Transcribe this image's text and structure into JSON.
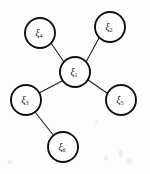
{
  "figure": {
    "type": "node-link-graph",
    "title": "",
    "background_color": "#fdfdfc",
    "stroke_color": "#101010",
    "node_fill_color": "#ffffff",
    "edge_color": "#1a1a1a",
    "node_radius": 15
  },
  "nodes": [
    {
      "id": "xi1",
      "symbol": "ξ",
      "subscript": "1",
      "label": "ξ₁",
      "cx": 75,
      "cy": 72,
      "r": 15,
      "role": "hub"
    },
    {
      "id": "xi2",
      "symbol": "ξ",
      "subscript": "2",
      "label": "ξ₂",
      "cx": 110,
      "cy": 27,
      "r": 15,
      "role": "leaf"
    },
    {
      "id": "xi3",
      "symbol": "ξ",
      "subscript": "3",
      "label": "ξ₃",
      "cx": 26,
      "cy": 100,
      "r": 15,
      "role": "branch"
    },
    {
      "id": "xi4",
      "symbol": "ξ",
      "subscript": "4",
      "label": "ξ₄",
      "cx": 40,
      "cy": 33,
      "r": 15,
      "role": "leaf"
    },
    {
      "id": "xi5",
      "symbol": "ξ",
      "subscript": "5",
      "label": "ξ₅",
      "cx": 121,
      "cy": 100,
      "r": 15,
      "role": "leaf"
    },
    {
      "id": "xi6",
      "symbol": "ξ",
      "subscript": "6",
      "label": "ξ₆",
      "cx": 63,
      "cy": 147,
      "r": 15,
      "role": "leaf"
    }
  ],
  "edges": [
    {
      "id": "e1",
      "from": "xi1",
      "to": "xi4",
      "x1": 64,
      "y1": 62,
      "x2": 51,
      "y2": 43
    },
    {
      "id": "e2",
      "from": "xi1",
      "to": "xi2",
      "x1": 86,
      "y1": 62,
      "x2": 99,
      "y2": 38
    },
    {
      "id": "e3",
      "from": "xi1",
      "to": "xi5",
      "x1": 88,
      "y1": 80,
      "x2": 107,
      "y2": 93
    },
    {
      "id": "e4",
      "from": "xi1",
      "to": "xi3",
      "x1": 62,
      "y1": 81,
      "x2": 39,
      "y2": 93
    },
    {
      "id": "e5",
      "from": "xi3",
      "to": "xi6",
      "x1": 35,
      "y1": 112,
      "x2": 54,
      "y2": 136
    }
  ],
  "counts": {
    "node_count": 6,
    "edge_count": 5
  }
}
